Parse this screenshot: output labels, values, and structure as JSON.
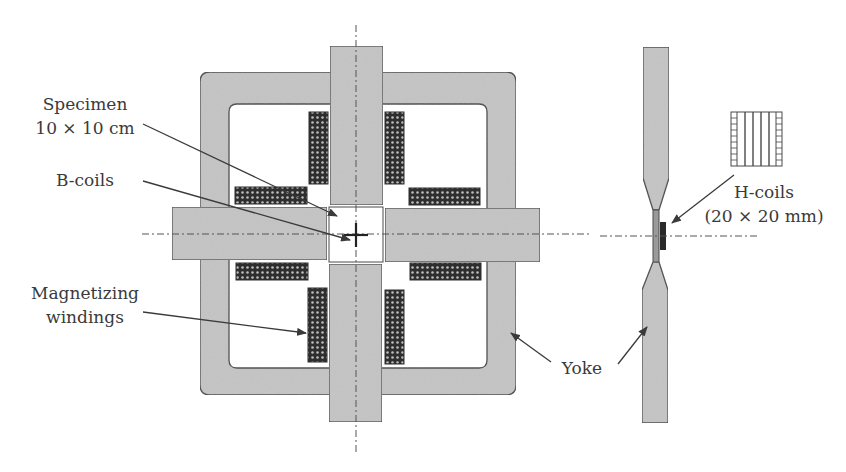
{
  "figure": {
    "colors": {
      "background": "#ffffff",
      "yoke_fill": "#c4c4c4",
      "outline": "#4a4a4a",
      "winding_dark": "#2e2e2e",
      "winding_dot": "#bdbdbd",
      "text": "#3a3a3a",
      "hcoil_block": "#2a2a2a"
    }
  },
  "labels": {
    "specimen_line1": "Specimen",
    "specimen_line2": "10 × 10 cm",
    "b_coils": "B-coils",
    "magnetizing_line1": "Magnetizing",
    "magnetizing_line2": "windings",
    "yoke": "Yoke",
    "h_coils_line1": "H-coils",
    "h_coils_line2": "(20 × 20 mm)"
  },
  "components": [
    {
      "name": "yoke",
      "view": "plan",
      "shape": "square frame with rounded corners"
    },
    {
      "name": "pole-arms",
      "view": "plan",
      "count": 4
    },
    {
      "name": "magnetizing-windings",
      "view": "plan",
      "count": 8
    },
    {
      "name": "specimen",
      "view": "plan",
      "size": "10 × 10 cm"
    },
    {
      "name": "b-coils",
      "view": "plan",
      "marker": "cross at specimen centre"
    },
    {
      "name": "side-view-yoke",
      "view": "side",
      "count": 2
    },
    {
      "name": "h-coils",
      "view": "side",
      "size": "20 × 20 mm"
    }
  ]
}
